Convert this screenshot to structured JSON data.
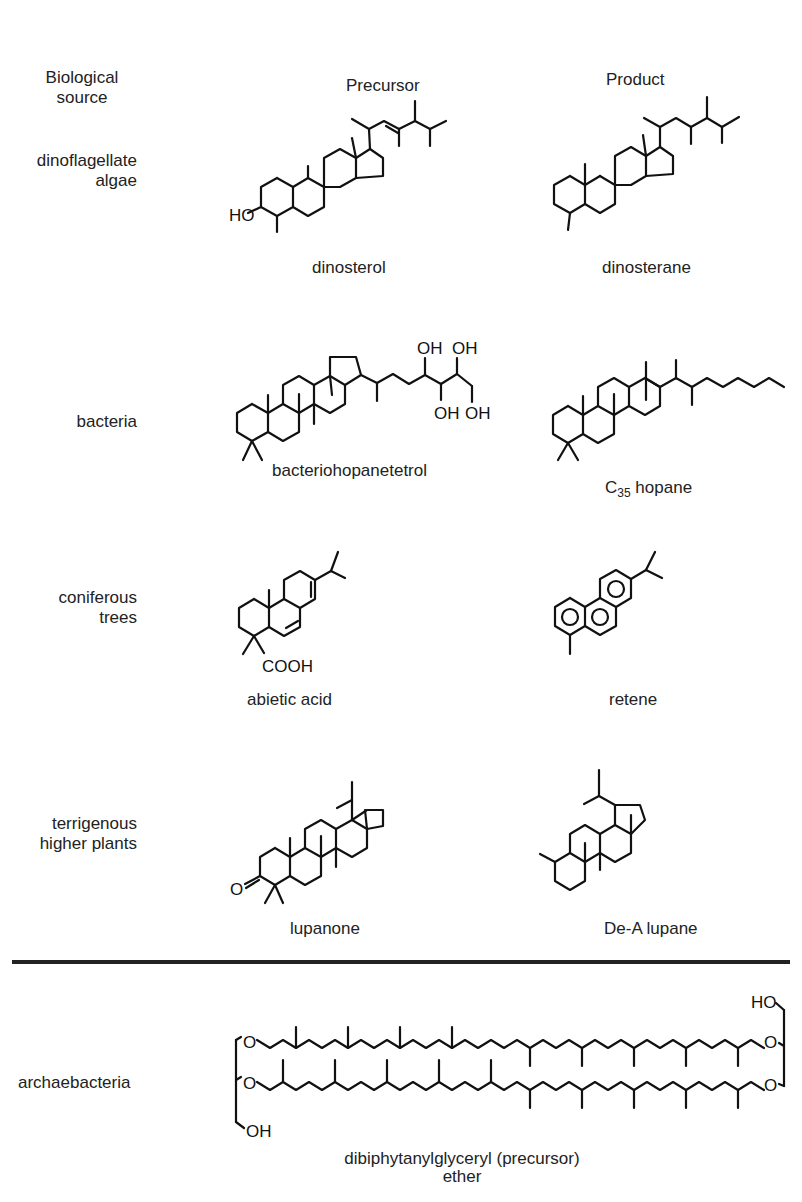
{
  "header": {
    "source_column": "Biological\nsource",
    "source_line1": "Biological",
    "source_line2": "source",
    "precursor_column": "Precursor",
    "product_column": "Product"
  },
  "rows": [
    {
      "source_line1": "dinoflagellate",
      "source_line2": "algae",
      "precursor": {
        "name": "dinosterol",
        "atom_labels": [
          "HO"
        ]
      },
      "product": {
        "name": "dinosterane",
        "atom_labels": []
      }
    },
    {
      "source_line1": "bacteria",
      "source_line2": "",
      "precursor": {
        "name": "bacteriohopanetetrol",
        "atom_labels": [
          "OH",
          "OH",
          "OH",
          "OH"
        ]
      },
      "product": {
        "name_prefix": "C",
        "name_subscript": "35",
        "name_suffix": " hopane",
        "name": "C35 hopane",
        "atom_labels": []
      }
    },
    {
      "source_line1": "coniferous",
      "source_line2": "trees",
      "precursor": {
        "name": "abietic acid",
        "atom_labels": [
          "COOH"
        ]
      },
      "product": {
        "name": "retene",
        "atom_labels": []
      }
    },
    {
      "source_line1": "terrigenous",
      "source_line2": "higher plants",
      "precursor": {
        "name": "lupanone",
        "atom_labels": [
          "O"
        ]
      },
      "product": {
        "name": "De-A lupane",
        "atom_labels": []
      }
    }
  ],
  "archaea": {
    "source": "archaebacteria",
    "name_line1": "dibiphytanylglyceryl (precursor)",
    "name_line2": "ether",
    "atom_labels": {
      "ho": "HO",
      "oh": "OH",
      "o": "O"
    }
  }
}
